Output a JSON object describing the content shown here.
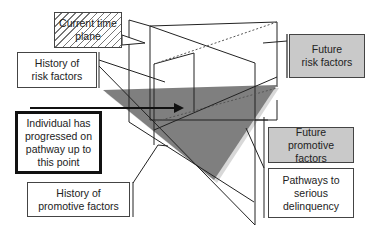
{
  "diagram": {
    "labels": {
      "current_time_plane": "Current time\nplane",
      "history_risk": "History of\nrisk factors",
      "individual_progressed": "Individual has\nprogressed on\npathway up to\nthis point",
      "history_promotive": "History of\npromotive factors",
      "future_risk": "Future\nrisk factors",
      "future_promotive": "Future\npromotive\nfactors",
      "pathways": "Pathways to\nserious\ndelinquency"
    },
    "colors": {
      "line": "#222222",
      "triangle_plane": "#7f7f7f",
      "gray_box": "#c9c9c9",
      "hatch": "#777777"
    }
  }
}
